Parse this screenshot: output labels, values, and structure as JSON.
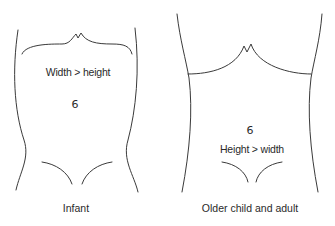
{
  "panels": [
    {
      "id": "infant",
      "caption": "Infant",
      "proportion_label": "Width > height",
      "navel_glyph": "6"
    },
    {
      "id": "older-child-adult",
      "caption": "Older child and adult",
      "proportion_label": "Height > width",
      "navel_glyph": "6"
    }
  ],
  "colors": {
    "line": "#3a3a3a",
    "background": "#ffffff"
  }
}
